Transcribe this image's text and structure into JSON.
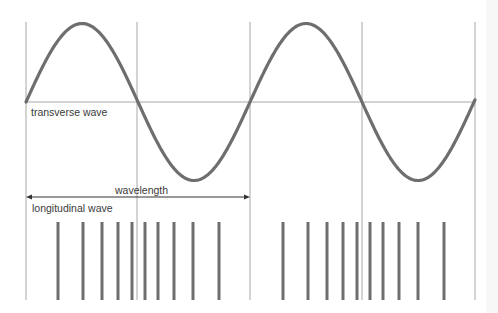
{
  "labels": {
    "transverse": "transverse wave",
    "wavelength": "wavelength",
    "longitudinal": "longitudinal wave"
  },
  "colors": {
    "wave": "#6e6e6e",
    "grid": "#a8a8a8",
    "text": "#3a3a3a",
    "arrow": "#333333"
  },
  "geometry": {
    "grid_x": [
      26,
      137,
      250,
      362,
      475
    ],
    "grid_top": 22,
    "grid_bottom": 300,
    "axis_y": 102,
    "peak_y": 23,
    "trough_y": 180,
    "wavelength_arrow": {
      "x1": 26,
      "x2": 250,
      "y": 197
    },
    "bars_top": 222,
    "bars_bottom": 300,
    "bars_x": [
      58,
      83,
      102,
      118,
      132,
      145,
      158,
      174,
      193,
      219,
      283,
      308,
      327,
      343,
      357,
      370,
      383,
      399,
      418,
      444
    ]
  }
}
